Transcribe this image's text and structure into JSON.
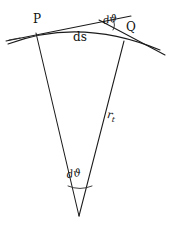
{
  "figure": {
    "type": "geometry-diagram",
    "background_color": "#ffffff",
    "stroke_color": "#1b1b1b",
    "labels": {
      "point_p": "P",
      "point_q": "Q",
      "arc_length": "ds",
      "angle_top": "dϑ",
      "angle_bottom": "dϑ",
      "radius": "r",
      "radius_subscript": "t"
    },
    "geometry": {
      "point_p": [
        36,
        32
      ],
      "point_q": [
        124,
        40
      ],
      "apex": [
        79,
        216
      ],
      "arc_sagitta_control": [
        80,
        19
      ],
      "tangent_intersection": [
        100,
        22
      ]
    }
  }
}
